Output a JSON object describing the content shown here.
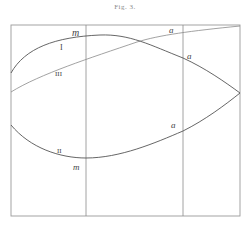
{
  "figure": {
    "title": "Fig. 3.",
    "frame": {
      "x": 11,
      "y": 25,
      "width": 229,
      "height": 191
    },
    "vertical_lines": [
      86,
      183
    ],
    "curves": [
      {
        "id": "I",
        "label": "I",
        "description": "upper arc rising from left edge, peaking near m, descending to right tip"
      },
      {
        "id": "III",
        "label": "III",
        "description": "gently rising line from left edge to upper right corner"
      },
      {
        "id": "II",
        "label": "II",
        "description": "lower arc from left edge, minimum at m, rising to right tip"
      }
    ],
    "labels": {
      "curve_I": "I",
      "curve_II": "II",
      "curve_III": "III",
      "m_upper": "m",
      "m_lower": "m",
      "a_top": "a",
      "a_upper": "a",
      "a_lower": "a"
    }
  }
}
